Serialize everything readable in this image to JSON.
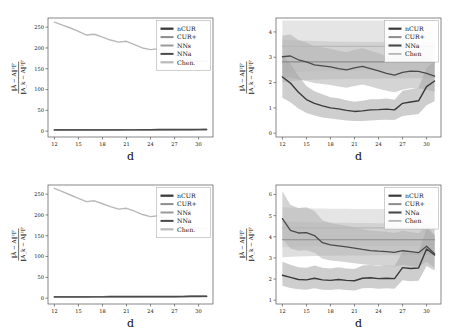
{
  "figure": {
    "background": "#ffffff",
    "panel_count": 4,
    "axis_color": "#555555",
    "text_color": "#111111"
  },
  "series_colors": {
    "nCUR": "#3a3a3a",
    "CUR+": "#8c8c8c",
    "NNs": "#9a9a9a",
    "NNa": "#4a4a4a",
    "Chen": "#b8b8b8",
    "band_light": "#d0d0d0",
    "band_mid": "#b5b5b5",
    "band_dark": "#a0a0a0"
  },
  "axis_labels": {
    "x": "d",
    "y_numerator": "‖Ã − A‖²F",
    "y_denominator": "‖A_k − A‖²F"
  },
  "chart_data": [
    {
      "id": "top-left",
      "type": "line",
      "title": "",
      "xlabel": "d",
      "ylabel": "||A~ - A||_F^2 / ||A_k - A||_F^2",
      "xticks": [
        12,
        15,
        18,
        21,
        24,
        27,
        30
      ],
      "yticks": [
        0,
        50,
        100,
        150,
        200,
        250
      ],
      "xlim": [
        11.2,
        31.8
      ],
      "ylim": [
        -14,
        272
      ],
      "grid": false,
      "legend_position": "upper-right",
      "legend": [
        "nCUR",
        "CUR+",
        "NNs",
        "NNa",
        "Chen."
      ],
      "x": [
        12,
        13,
        14,
        15,
        16,
        17,
        18,
        19,
        20,
        21,
        22,
        23,
        24,
        25,
        26,
        27,
        28,
        29,
        30,
        31
      ],
      "series": [
        {
          "name": "Chen.",
          "color": "#b8b8b8",
          "width": 1.4,
          "values": [
            262,
            255,
            248,
            240,
            231,
            233,
            226,
            219,
            214,
            216,
            208,
            200,
            196,
            198,
            190,
            182,
            176,
            170,
            168,
            168
          ]
        },
        {
          "name": "nCUR",
          "color": "#3a3a3a",
          "width": 1.5,
          "values": [
            3.1,
            3.2,
            3.2,
            3.3,
            3.3,
            3.4,
            3.4,
            3.5,
            3.5,
            3.6,
            3.6,
            3.7,
            3.7,
            3.8,
            3.8,
            3.9,
            4.0,
            4.1,
            4.2,
            4.3
          ]
        },
        {
          "name": "CUR+",
          "color": "#8c8c8c",
          "width": 1.2,
          "values": [
            2.6,
            2.7,
            2.7,
            2.8,
            2.8,
            2.9,
            2.9,
            3.0,
            3.0,
            3.1,
            3.1,
            3.2,
            3.2,
            3.3,
            3.3,
            3.4,
            3.5,
            3.6,
            3.7,
            3.8
          ]
        },
        {
          "name": "NNs",
          "color": "#9a9a9a",
          "width": 1.2,
          "values": [
            2.2,
            2.3,
            2.3,
            2.4,
            2.4,
            2.5,
            2.5,
            2.6,
            2.6,
            2.7,
            2.7,
            2.8,
            2.8,
            2.9,
            2.9,
            3.0,
            3.1,
            3.2,
            3.3,
            3.4
          ]
        },
        {
          "name": "NNa",
          "color": "#4a4a4a",
          "width": 1.2,
          "values": [
            2.9,
            3.0,
            3.0,
            3.1,
            3.1,
            3.2,
            3.2,
            3.3,
            3.3,
            3.4,
            3.4,
            3.5,
            3.5,
            3.6,
            3.6,
            3.7,
            3.8,
            3.9,
            4.0,
            4.1
          ]
        }
      ]
    },
    {
      "id": "top-right",
      "type": "line",
      "title": "",
      "xlabel": "d",
      "ylabel": "||A~ - A||_F^2 / ||A_k - A||_F^2",
      "xticks": [
        12,
        15,
        18,
        21,
        24,
        27,
        30
      ],
      "yticks": [
        0,
        1,
        2,
        3,
        4
      ],
      "xlim": [
        11.2,
        31.8
      ],
      "ylim": [
        -0.15,
        4.55
      ],
      "grid": false,
      "legend_position": "upper-right",
      "legend": [
        "nCUR",
        "CUR+",
        "NNa",
        "Chen"
      ],
      "x": [
        12,
        13,
        14,
        15,
        16,
        17,
        18,
        19,
        20,
        21,
        22,
        23,
        24,
        25,
        26,
        27,
        28,
        29,
        30,
        31
      ],
      "series": [
        {
          "name": "Chen",
          "color": "#b8b8b8",
          "width": 1.1,
          "constant": 3.43,
          "values": [
            3.43,
            3.43,
            3.43,
            3.43,
            3.43,
            3.43,
            3.43,
            3.43,
            3.43,
            3.43,
            3.43,
            3.43,
            3.43,
            3.43,
            3.43,
            3.43,
            3.43,
            3.43,
            3.43,
            3.43
          ],
          "band_lo": [
            2.35,
            2.4,
            2.42,
            2.44,
            2.45,
            2.46,
            2.46,
            2.47,
            2.47,
            2.47,
            2.48,
            2.48,
            2.48,
            2.48,
            2.49,
            2.49,
            2.49,
            2.49,
            2.5,
            2.5
          ],
          "band_hi": [
            4.45,
            4.45,
            4.45,
            4.45,
            4.45,
            4.45,
            4.45,
            4.45,
            4.45,
            4.45,
            4.45,
            4.45,
            4.45,
            4.45,
            4.45,
            4.45,
            4.45,
            4.45,
            4.45,
            4.45
          ]
        },
        {
          "name": "CUR+",
          "color": "#8c8c8c",
          "width": 1.2,
          "constant": 2.82,
          "values": [
            2.82,
            2.82,
            2.82,
            2.82,
            2.82,
            2.82,
            2.82,
            2.82,
            2.82,
            2.82,
            2.82,
            2.82,
            2.82,
            2.82,
            2.82,
            2.82,
            2.82,
            2.82,
            2.82,
            2.82
          ],
          "band_lo": [
            2.0,
            2.05,
            2.08,
            2.1,
            2.11,
            2.12,
            2.13,
            2.13,
            2.14,
            2.14,
            2.15,
            2.15,
            2.15,
            2.16,
            2.16,
            2.16,
            2.17,
            2.17,
            2.17,
            2.18
          ],
          "band_hi": [
            3.7,
            3.68,
            3.66,
            3.65,
            3.64,
            3.63,
            3.62,
            3.62,
            3.61,
            3.61,
            3.6,
            3.6,
            3.6,
            3.59,
            3.59,
            3.59,
            3.58,
            3.58,
            3.58,
            3.57
          ]
        },
        {
          "name": "NNa",
          "color": "#4a4a4a",
          "width": 1.3,
          "values": [
            3.02,
            3.05,
            2.9,
            2.82,
            2.7,
            2.66,
            2.62,
            2.55,
            2.5,
            2.58,
            2.64,
            2.55,
            2.46,
            2.36,
            2.29,
            2.4,
            2.45,
            2.44,
            2.36,
            2.25
          ],
          "band_lo": [
            2.18,
            2.2,
            2.12,
            2.06,
            1.98,
            1.94,
            1.9,
            1.84,
            1.8,
            1.86,
            1.92,
            1.84,
            1.76,
            1.68,
            1.62,
            1.72,
            1.78,
            1.78,
            1.72,
            1.64
          ],
          "band_hi": [
            3.86,
            3.9,
            3.68,
            3.58,
            3.42,
            3.38,
            3.34,
            3.26,
            3.2,
            3.3,
            3.36,
            3.26,
            3.16,
            3.04,
            2.96,
            3.08,
            3.12,
            3.1,
            3.0,
            2.86
          ]
        },
        {
          "name": "nCUR",
          "color": "#3a3a3a",
          "width": 1.4,
          "values": [
            2.22,
            1.98,
            1.62,
            1.33,
            1.18,
            1.08,
            1.0,
            0.96,
            0.9,
            0.86,
            0.88,
            0.92,
            0.93,
            0.95,
            0.92,
            1.18,
            1.23,
            1.28,
            1.84,
            2.06
          ],
          "band_lo": [
            1.4,
            1.22,
            0.98,
            0.8,
            0.7,
            0.62,
            0.58,
            0.54,
            0.5,
            0.48,
            0.48,
            0.5,
            0.52,
            0.53,
            0.52,
            0.68,
            0.72,
            0.76,
            1.1,
            1.26
          ],
          "band_hi": [
            3.04,
            2.74,
            2.26,
            1.86,
            1.66,
            1.54,
            1.42,
            1.38,
            1.3,
            1.24,
            1.28,
            1.34,
            1.34,
            1.37,
            1.32,
            1.68,
            1.74,
            1.8,
            2.58,
            2.86
          ]
        }
      ]
    },
    {
      "id": "bottom-left",
      "type": "line",
      "title": "",
      "xlabel": "d",
      "ylabel": "||A~ - A||_F^2 / ||A_k - A||_F^2",
      "xticks": [
        12,
        15,
        18,
        21,
        24,
        27,
        30
      ],
      "yticks": [
        0,
        50,
        100,
        150,
        200,
        250
      ],
      "xlim": [
        11.2,
        31.8
      ],
      "ylim": [
        -14,
        272
      ],
      "grid": false,
      "legend_position": "upper-right",
      "legend": [
        "nCUR",
        "CUR+",
        "NNs",
        "NNa",
        "Chen."
      ],
      "x": [
        12,
        13,
        14,
        15,
        16,
        17,
        18,
        19,
        20,
        21,
        22,
        23,
        24,
        25,
        26,
        27,
        28,
        29,
        30,
        31
      ],
      "series": [
        {
          "name": "Chen.",
          "color": "#b8b8b8",
          "width": 1.4,
          "values": [
            264,
            256,
            248,
            240,
            232,
            234,
            227,
            220,
            214,
            216,
            209,
            201,
            196,
            198,
            190,
            182,
            176,
            170,
            168,
            168
          ]
        },
        {
          "name": "nCUR",
          "color": "#3a3a3a",
          "width": 1.5,
          "values": [
            3.4,
            3.5,
            3.5,
            3.6,
            3.6,
            3.7,
            3.7,
            3.8,
            3.8,
            3.9,
            3.9,
            4.0,
            4.0,
            4.1,
            4.1,
            4.2,
            4.3,
            4.4,
            4.5,
            4.6
          ]
        },
        {
          "name": "CUR+",
          "color": "#8c8c8c",
          "width": 1.2,
          "values": [
            2.8,
            2.9,
            2.9,
            3.0,
            3.0,
            3.1,
            3.1,
            3.2,
            3.2,
            3.3,
            3.3,
            3.4,
            3.4,
            3.5,
            3.5,
            3.6,
            3.7,
            3.8,
            3.9,
            4.0
          ]
        },
        {
          "name": "NNs",
          "color": "#9a9a9a",
          "width": 1.2,
          "values": [
            2.4,
            2.5,
            2.5,
            2.6,
            2.6,
            2.7,
            2.7,
            2.8,
            2.8,
            2.9,
            2.9,
            3.0,
            3.0,
            3.1,
            3.1,
            3.2,
            3.3,
            3.4,
            3.5,
            3.6
          ]
        },
        {
          "name": "NNa",
          "color": "#4a4a4a",
          "width": 1.2,
          "values": [
            3.1,
            3.2,
            3.2,
            3.3,
            3.3,
            3.4,
            3.4,
            3.5,
            3.5,
            3.6,
            3.6,
            3.7,
            3.7,
            3.8,
            3.8,
            3.9,
            4.0,
            4.1,
            4.2,
            4.3
          ]
        }
      ]
    },
    {
      "id": "bottom-right",
      "type": "line",
      "title": "",
      "xlabel": "d",
      "ylabel": "||A~ - A||_F^2 / ||A_k - A||_F^2",
      "xticks": [
        12,
        15,
        18,
        21,
        24,
        27,
        30
      ],
      "yticks": [
        1,
        2,
        3,
        4,
        5,
        6
      ],
      "xlim": [
        11.2,
        31.8
      ],
      "ylim": [
        0.82,
        6.45
      ],
      "grid": false,
      "legend_position": "upper-right",
      "legend": [
        "nCUR",
        "CUR+",
        "NNa",
        "Chen"
      ],
      "x": [
        12,
        13,
        14,
        15,
        16,
        17,
        18,
        19,
        20,
        21,
        22,
        23,
        24,
        25,
        26,
        27,
        28,
        29,
        30,
        31
      ],
      "series": [
        {
          "name": "Chen",
          "color": "#b8b8b8",
          "width": 1.1,
          "constant": 4.42,
          "values": [
            4.42,
            4.42,
            4.42,
            4.42,
            4.42,
            4.42,
            4.42,
            4.42,
            4.42,
            4.42,
            4.42,
            4.42,
            4.42,
            4.42,
            4.42,
            4.42,
            4.42,
            4.42,
            4.42,
            4.42
          ],
          "band_lo": [
            3.5,
            3.52,
            3.53,
            3.54,
            3.55,
            3.55,
            3.56,
            3.56,
            3.56,
            3.57,
            3.57,
            3.57,
            3.57,
            3.58,
            3.58,
            3.58,
            3.58,
            3.58,
            3.59,
            3.59
          ],
          "band_hi": [
            5.4,
            5.38,
            5.36,
            5.35,
            5.34,
            5.34,
            5.33,
            5.33,
            5.33,
            5.32,
            5.32,
            5.32,
            5.32,
            5.31,
            5.31,
            5.31,
            5.31,
            5.31,
            5.3,
            5.3
          ]
        },
        {
          "name": "CUR+",
          "color": "#8c8c8c",
          "width": 1.2,
          "constant": 3.86,
          "values": [
            3.86,
            3.86,
            3.86,
            3.86,
            3.86,
            3.86,
            3.86,
            3.86,
            3.86,
            3.86,
            3.86,
            3.86,
            3.86,
            3.86,
            3.86,
            3.86,
            3.86,
            3.86,
            3.86,
            3.86
          ],
          "band_lo": [
            3.02,
            3.05,
            3.07,
            3.08,
            3.09,
            3.1,
            3.1,
            3.11,
            3.11,
            3.12,
            3.12,
            3.12,
            3.13,
            3.13,
            3.13,
            3.13,
            3.14,
            3.14,
            3.14,
            3.14
          ],
          "band_hi": [
            4.74,
            4.72,
            4.7,
            4.69,
            4.68,
            4.67,
            4.67,
            4.66,
            4.66,
            4.65,
            4.65,
            4.65,
            4.64,
            4.64,
            4.64,
            4.64,
            4.63,
            4.63,
            4.63,
            4.63
          ]
        },
        {
          "name": "NNa",
          "color": "#4a4a4a",
          "width": 1.3,
          "values": [
            4.86,
            4.3,
            4.18,
            4.2,
            4.06,
            3.72,
            3.62,
            3.57,
            3.52,
            3.46,
            3.4,
            3.35,
            3.32,
            3.3,
            3.26,
            3.34,
            3.3,
            3.25,
            3.55,
            3.2
          ],
          "band_lo": [
            3.9,
            3.44,
            3.34,
            3.36,
            3.24,
            2.96,
            2.88,
            2.84,
            2.8,
            2.75,
            2.7,
            2.66,
            2.64,
            2.62,
            2.59,
            2.66,
            2.62,
            2.58,
            2.82,
            2.54
          ],
          "band_hi": [
            6.15,
            5.52,
            5.36,
            5.4,
            5.22,
            4.78,
            4.65,
            4.58,
            4.52,
            4.44,
            4.36,
            4.3,
            4.26,
            4.24,
            4.18,
            4.28,
            4.23,
            4.17,
            4.56,
            4.1
          ]
        },
        {
          "name": "nCUR",
          "color": "#3a3a3a",
          "width": 1.4,
          "values": [
            2.18,
            2.08,
            1.98,
            1.96,
            2.04,
            1.96,
            1.94,
            1.98,
            1.94,
            1.92,
            2.04,
            2.06,
            2.02,
            2.04,
            2.02,
            2.54,
            2.5,
            2.52,
            3.42,
            3.14
          ],
          "band_lo": [
            1.68,
            1.58,
            1.52,
            1.5,
            1.56,
            1.5,
            1.48,
            1.52,
            1.48,
            1.46,
            1.56,
            1.58,
            1.54,
            1.56,
            1.54,
            1.94,
            1.9,
            1.92,
            2.62,
            2.4
          ],
          "band_hi": [
            2.82,
            2.68,
            2.56,
            2.54,
            2.64,
            2.54,
            2.5,
            2.56,
            2.5,
            2.48,
            2.64,
            2.66,
            2.62,
            2.64,
            2.62,
            3.28,
            3.24,
            3.26,
            4.42,
            4.06
          ]
        }
      ]
    }
  ]
}
